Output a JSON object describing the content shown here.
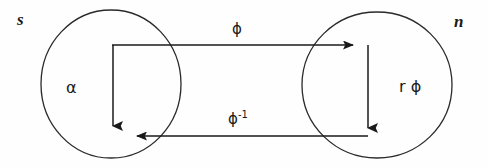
{
  "figure": {
    "type": "commutative-diagram",
    "caption": "",
    "background_color": "#fefefe",
    "stroke_color": "#1a1a1a",
    "width": 489,
    "height": 168
  },
  "sets": [
    {
      "id": "left",
      "outer_label": "s",
      "inner_label": "α",
      "cx": 111,
      "cy": 84,
      "rx": 70,
      "ry": 74
    },
    {
      "id": "right",
      "outer_label": "n",
      "inner_label": "r ϕ",
      "cx": 377,
      "cy": 85,
      "rx": 75,
      "ry": 73
    }
  ],
  "arrows": [
    {
      "id": "top",
      "label": "ϕ",
      "label_superscript": "",
      "direction": "left-to-right",
      "from_x": 112,
      "from_y": 45,
      "to_x": 362,
      "to_y": 45
    },
    {
      "id": "bottom",
      "label": "ϕ",
      "label_superscript": "-1",
      "direction": "right-to-left",
      "from_x": 368,
      "from_y": 136,
      "to_x": 128,
      "to_y": 136
    },
    {
      "id": "left-vertical",
      "label": "",
      "label_superscript": "",
      "direction": "top-to-bottom",
      "from_x": 113,
      "from_y": 46,
      "to_x": 113,
      "to_y": 134
    },
    {
      "id": "right-vertical",
      "label": "",
      "label_superscript": "",
      "direction": "top-to-bottom",
      "from_x": 368,
      "from_y": 46,
      "to_x": 368,
      "to_y": 136
    }
  ]
}
